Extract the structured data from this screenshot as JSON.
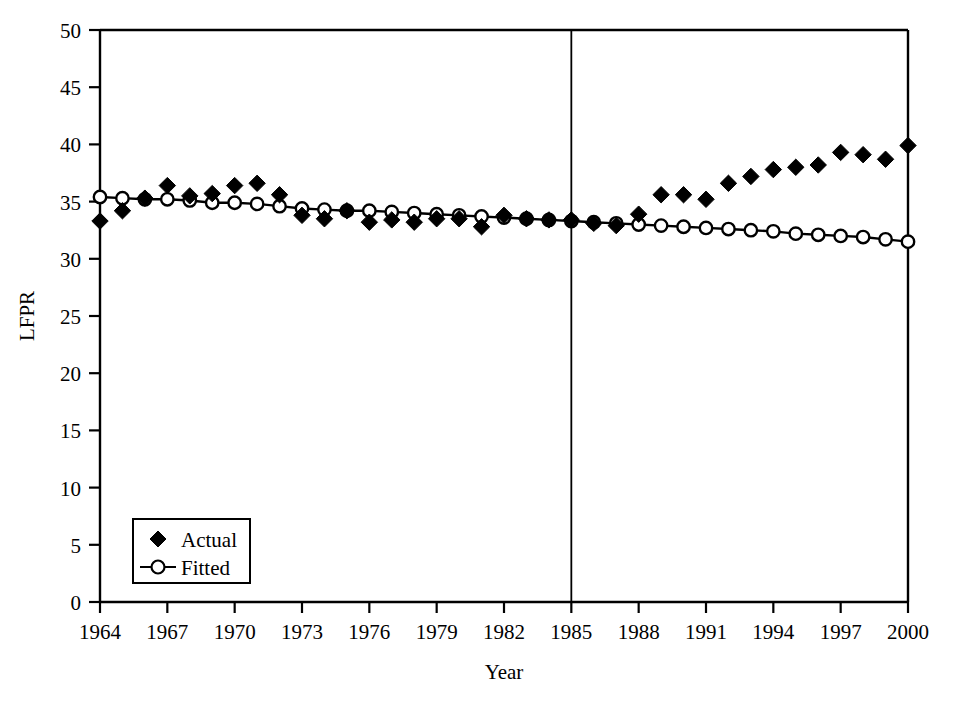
{
  "chart_data": {
    "type": "line",
    "title": "",
    "subtitle": "",
    "xlabel": "Year",
    "ylabel": "LFPR",
    "xlim": [
      1964,
      2000
    ],
    "ylim": [
      0,
      50
    ],
    "grid": false,
    "legend_position": "bottom-left",
    "x_tick_labels": [
      "1964",
      "1967",
      "1970",
      "1973",
      "1976",
      "1979",
      "1982",
      "1985",
      "1988",
      "1991",
      "1994",
      "1997",
      "2000"
    ],
    "x_tick_values": [
      1964,
      1967,
      1970,
      1973,
      1976,
      1979,
      1982,
      1985,
      1988,
      1991,
      1994,
      1997,
      2000
    ],
    "x_minor_values": [
      1965,
      1966,
      1968,
      1969,
      1971,
      1972,
      1974,
      1975,
      1977,
      1978,
      1980,
      1981,
      1983,
      1984,
      1986,
      1987,
      1989,
      1990,
      1992,
      1993,
      1995,
      1996,
      1998,
      1999
    ],
    "y_tick_labels": [
      "0",
      "5",
      "10",
      "15",
      "20",
      "25",
      "30",
      "35",
      "40",
      "45",
      "50"
    ],
    "y_tick_values": [
      0,
      5,
      10,
      15,
      20,
      25,
      30,
      35,
      40,
      45,
      50
    ],
    "x": [
      1964,
      1965,
      1966,
      1967,
      1968,
      1969,
      1970,
      1971,
      1972,
      1973,
      1974,
      1975,
      1976,
      1977,
      1978,
      1979,
      1980,
      1981,
      1982,
      1983,
      1984,
      1985,
      1986,
      1987,
      1988,
      1989,
      1990,
      1991,
      1992,
      1993,
      1994,
      1995,
      1996,
      1997,
      1998,
      1999,
      2000
    ],
    "series": [
      {
        "name": "Actual",
        "marker": "filled-diamond",
        "line": false,
        "color": "#000000",
        "values": [
          33.3,
          34.2,
          35.3,
          36.4,
          35.5,
          35.7,
          36.4,
          36.6,
          35.6,
          33.8,
          33.5,
          34.2,
          33.2,
          33.4,
          33.2,
          33.5,
          33.5,
          32.8,
          33.8,
          33.5,
          33.4,
          33.4,
          33.1,
          32.9,
          33.9,
          35.6,
          35.6,
          35.2,
          36.6,
          37.2,
          37.8,
          38.0,
          38.2,
          39.3,
          39.1,
          38.7,
          39.9
        ]
      },
      {
        "name": "Fitted",
        "marker": "open-circle",
        "line": true,
        "color": "#000000",
        "values": [
          35.4,
          35.3,
          35.2,
          35.2,
          35.1,
          34.9,
          34.9,
          34.8,
          34.6,
          34.4,
          34.3,
          34.2,
          34.2,
          34.1,
          34.0,
          33.9,
          33.8,
          33.7,
          33.6,
          33.5,
          33.4,
          33.3,
          33.2,
          33.1,
          33.0,
          32.9,
          32.8,
          32.7,
          32.6,
          32.5,
          32.4,
          32.2,
          32.1,
          32.0,
          31.9,
          31.7,
          31.5
        ]
      }
    ],
    "annotations": [
      {
        "type": "vertical-line",
        "name": "break-year-line",
        "x": 1985,
        "label": ""
      }
    ]
  },
  "legend": {
    "items": [
      {
        "label": "Actual",
        "marker": "filled-diamond"
      },
      {
        "label": "Fitted",
        "marker": "line-open-circle"
      }
    ]
  },
  "axis": {
    "y_title": "LFPR",
    "x_title": "Year"
  }
}
